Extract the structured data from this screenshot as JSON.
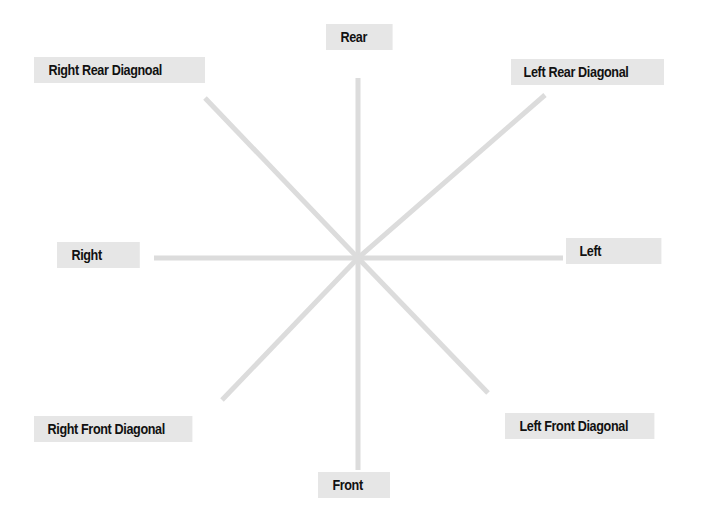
{
  "diagram": {
    "labels": {
      "rear": "Rear",
      "right_rear_diagonal": "Right Rear Diagnoal",
      "left_rear_diagonal": "Left Rear Diagonal",
      "right": "Right",
      "left": "Left",
      "right_front_diagonal": "Right Front Diagonal",
      "left_front_diagonal": "Left Front Diagonal",
      "front": "Front"
    },
    "colors": {
      "line": "#dcdcdc",
      "label_bg": "#e6e6e6",
      "label_text": "#111111"
    },
    "center": [
      358,
      258
    ]
  }
}
